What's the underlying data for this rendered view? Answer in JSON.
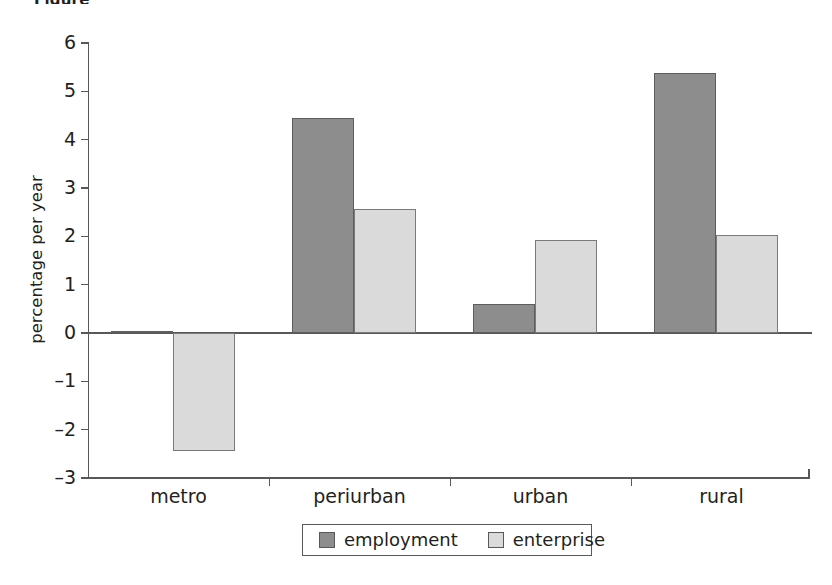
{
  "caption_fragment": "Figure",
  "chart_data": {
    "type": "bar",
    "title": "",
    "subtitle": "",
    "xlabel": "",
    "ylabel": "percentage per year",
    "categories": [
      "metro",
      "periurban",
      "urban",
      "rural"
    ],
    "series": [
      {
        "name": "employment",
        "color": "#8d8d8d",
        "values": [
          0.05,
          4.45,
          0.6,
          5.37
        ]
      },
      {
        "name": "enterprise",
        "color": "#dadada",
        "values": [
          -2.45,
          2.57,
          1.93,
          2.03
        ]
      }
    ],
    "ylim": [
      -3,
      6
    ],
    "ytick_labels": [
      "6",
      "5",
      "4",
      "3",
      "2",
      "1",
      "0",
      "–1",
      "–2",
      "–3"
    ],
    "ytick_values": [
      6,
      5,
      4,
      3,
      2,
      1,
      0,
      -1,
      -2,
      -3
    ],
    "grid": false,
    "legend_position": "bottom",
    "legend_entries": [
      "employment",
      "enterprise"
    ],
    "annotations": []
  }
}
